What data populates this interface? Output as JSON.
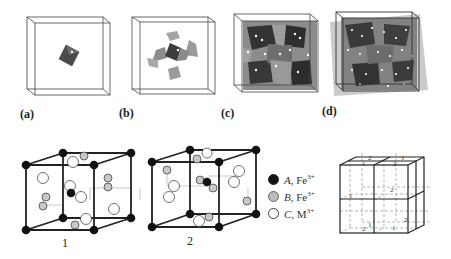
{
  "figure": {
    "top_row": {
      "panels": [
        {
          "label": "(a)",
          "description": "single dark octahedron in unit cell"
        },
        {
          "label": "(b)",
          "description": "central octahedron with surrounding tetrahedra"
        },
        {
          "label": "(c)",
          "description": "partially filled cell of polyhedra"
        },
        {
          "label": "(d)",
          "description": "fully filled cell of polyhedra"
        }
      ]
    },
    "bottom_row": {
      "cubes": [
        {
          "label": "1"
        },
        {
          "label": "2"
        }
      ],
      "legend": [
        {
          "letter": "A",
          "ion": "Fe",
          "charge": "3+",
          "marker": "black-filled-circle",
          "color": "#111111"
        },
        {
          "letter": "B",
          "ion": "Fe",
          "charge": "3+",
          "marker": "gray-filled-circle",
          "color": "#bdbdbd"
        },
        {
          "letter": "C",
          "ion": "M",
          "charge": "3+",
          "marker": "white-circle",
          "color": "#ffffff"
        }
      ],
      "supercell": {
        "description": "2x2x2 arrangement of octants labeled 1 and 2",
        "labels": [
          "2",
          "1",
          "1",
          "2",
          "1",
          "2",
          "1",
          "2",
          "2",
          "1"
        ]
      }
    },
    "colors": {
      "line": "#222222",
      "dark_polyhedron": "#3a3a3a",
      "mid_polyhedron": "#7a7a7a",
      "light_polyhedron": "#a8a8a8"
    }
  }
}
